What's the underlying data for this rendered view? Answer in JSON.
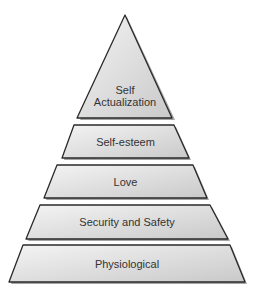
{
  "diagram": {
    "type": "pyramid",
    "levels": [
      {
        "label_line1": "Self",
        "label_line2": "Actualization"
      },
      {
        "label": "Self-esteem"
      },
      {
        "label": "Love"
      },
      {
        "label": "Security and Safety"
      },
      {
        "label": "Physiological"
      }
    ],
    "colors": {
      "fill_top": "#f2f2f2",
      "fill_bottom": "#c8c8c8",
      "stroke": "#2a2a2a",
      "shadow": "#9a9a9a",
      "text": "#333333"
    }
  }
}
